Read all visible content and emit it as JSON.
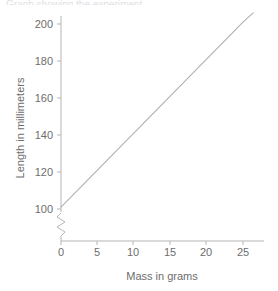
{
  "top_cropped_text": "Graph showing the experiment",
  "chart_data": {
    "type": "line",
    "title": "",
    "xlabel": "Mass in grams",
    "ylabel": "Length in millimeters",
    "xlim": [
      0,
      27
    ],
    "ylim": [
      100,
      204
    ],
    "xticks": [
      0,
      5,
      10,
      15,
      20,
      25
    ],
    "xticklabels": [
      "0",
      "5",
      "10",
      "15",
      "20",
      "25"
    ],
    "yticks": [
      100,
      120,
      140,
      160,
      180,
      200
    ],
    "yticklabels": [
      "100",
      "120",
      "140",
      "160",
      "180",
      "200"
    ],
    "grid": false,
    "legend": "none",
    "y_axis_break": true,
    "y_axis_break_symbol": "zigzag",
    "series": [
      {
        "name": "Length vs Mass",
        "color": "#b0b0b0",
        "x": [
          0,
          5,
          10,
          15,
          20,
          25,
          26.4
        ],
        "values": [
          101,
          121,
          141,
          161,
          181,
          201,
          206
        ]
      }
    ],
    "annotations": {
      "intercept": 101,
      "slope_mm_per_gram": 4
    }
  },
  "colors": {
    "axis": "#b5b5b5",
    "line": "#b0b0b0",
    "text": "#6d6d6d",
    "background": "#ffffff"
  }
}
